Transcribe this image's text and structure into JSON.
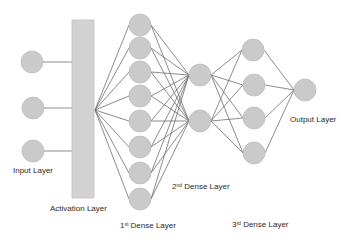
{
  "colors": {
    "node_fill": "#cacaca",
    "node_stroke": "#bdbdbd",
    "edge": "#6e6e6e",
    "activation_fill": "#d2d2d2",
    "activation_stroke": "#c2c2c2",
    "text": "#2b2b2b"
  },
  "layers": {
    "input": {
      "label": "Input Layer",
      "nodes": [
        [
          32,
          62
        ],
        [
          33,
          108
        ],
        [
          33,
          151
        ]
      ]
    },
    "activation": {
      "label": "Activation Layer",
      "rect": {
        "x": 72,
        "y": 20,
        "width": 22,
        "height": 178
      },
      "fanout_point": [
        95,
        110
      ]
    },
    "dense1": {
      "label_base": "1",
      "label_sup": "st",
      "label_rest": " Dense Layer",
      "nodes": [
        [
          140,
          25
        ],
        [
          140,
          48
        ],
        [
          140,
          72
        ],
        [
          140,
          96
        ],
        [
          140,
          121
        ],
        [
          140,
          147
        ],
        [
          140,
          173
        ],
        [
          140,
          199
        ]
      ]
    },
    "dense2": {
      "label_base": "2",
      "label_sup": "nd",
      "label_rest": " Dense Layer",
      "nodes": [
        [
          200,
          75
        ],
        [
          200,
          121
        ]
      ]
    },
    "dense3": {
      "label_base": "3",
      "label_sup": "rd",
      "label_rest": " Dense Layer",
      "nodes": [
        [
          253,
          50
        ],
        [
          254,
          85
        ],
        [
          254,
          118
        ],
        [
          254,
          153
        ]
      ]
    },
    "output": {
      "label": "Output Layer",
      "nodes": [
        [
          305,
          90
        ]
      ]
    }
  },
  "node_radius": 11
}
